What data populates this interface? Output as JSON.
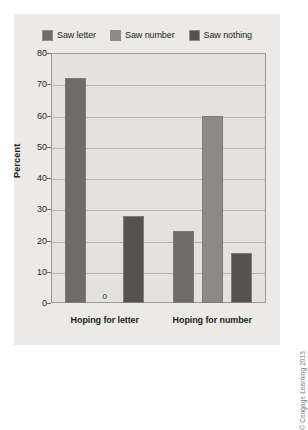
{
  "chart_data": {
    "type": "bar",
    "title": "",
    "xlabel": "",
    "ylabel": "Percent",
    "ylim": [
      0,
      80
    ],
    "yticks": [
      0,
      10,
      20,
      30,
      40,
      50,
      60,
      70,
      80
    ],
    "grid": true,
    "legend_position": "top-center",
    "categories": [
      "Hoping for letter",
      "Hoping for number"
    ],
    "series": [
      {
        "name": "Saw letter",
        "color": "#6e6c6a",
        "values": [
          72,
          23
        ]
      },
      {
        "name": "Saw number",
        "color": "#8c8a88",
        "values": [
          0,
          60
        ]
      },
      {
        "name": "Saw nothing",
        "color": "#55534f",
        "values": [
          28,
          16
        ]
      }
    ],
    "data_labels": [
      {
        "series": "Saw number",
        "category": "Hoping for letter",
        "text": "0"
      }
    ]
  },
  "credit": "© Cengage Learning 2013",
  "colors": {
    "figure_background": "#ffffff",
    "panel_background": "#eceae7",
    "plot_background": "#e4e2df",
    "gridline": "#b4b2b0",
    "axis": "#9a9a9a",
    "text": "#231f20"
  }
}
